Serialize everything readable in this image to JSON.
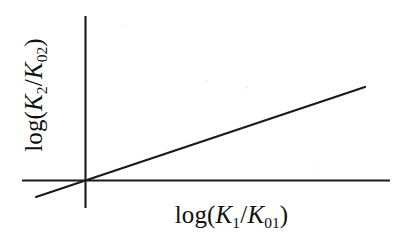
{
  "figure": {
    "background_color": "#ffffff",
    "stroke_color": "#1a1a1a",
    "width": 411,
    "height": 244
  },
  "axes": {
    "x_axis": {
      "name": "x-axis-line",
      "x1": 22,
      "y1": 180,
      "x2": 390,
      "y2": 180
    },
    "y_axis": {
      "name": "y-axis-line",
      "x1": 85,
      "y1": 16,
      "x2": 85,
      "y2": 208
    },
    "origin": {
      "x": 85,
      "y": 180
    }
  },
  "labels": {
    "x": {
      "full_text": "log(K1/K01)",
      "prefix": "log(",
      "numerator_var": "K",
      "numerator_sub": "1",
      "slash": "/",
      "denominator_var": "K",
      "denominator_sub": "01",
      "suffix": ")"
    },
    "y": {
      "full_text": "log(K2/K02)",
      "prefix": "log(",
      "numerator_var": "K",
      "numerator_sub": "2",
      "slash": "/",
      "denominator_var": "K",
      "denominator_sub": "02",
      "suffix": ")",
      "rotation_deg": -90
    }
  },
  "chart_data": {
    "type": "line",
    "title": "",
    "subtitle": "",
    "xlabel": "log(K1/K01)",
    "ylabel": "log(K2/K02)",
    "grid": false,
    "legend": false,
    "legend_position": "none",
    "axis_ticks": false,
    "tick_labels": {
      "x": [],
      "y": []
    },
    "xlim": [
      -0.175,
      1.0
    ],
    "ylim": [
      -0.12,
      0.66
    ],
    "series": [
      {
        "name": "linear-free-energy-relationship",
        "x": [
          -0.175,
          0.0,
          0.464,
          1.0
        ],
        "y": [
          -0.116,
          0.0,
          0.307,
          0.661
        ],
        "slope": 0.661,
        "intercept": 0.0,
        "color": "#1a1a1a",
        "width_px": 2.2,
        "style": "solid",
        "markers": "none",
        "pixel_endpoints": {
          "x1": 36,
          "y1": 197,
          "x2": 365,
          "y2": 87
        }
      }
    ],
    "annotations": []
  }
}
